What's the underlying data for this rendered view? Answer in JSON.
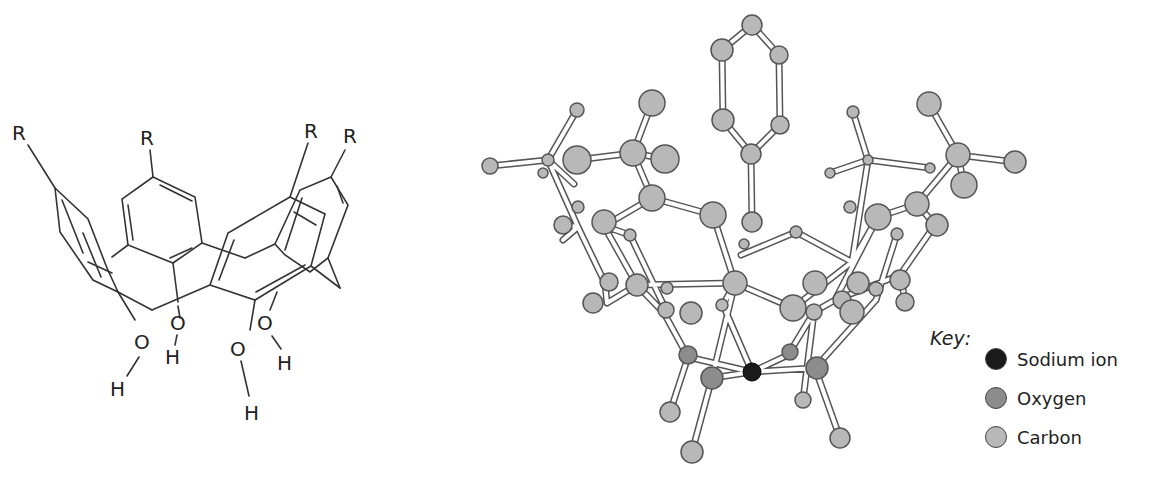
{
  "skeletal_formula": {
    "labels": {
      "r1": "R",
      "r2": "R",
      "r3": "R",
      "r4": "R",
      "o1": "O",
      "o2": "O",
      "o3": "O",
      "o4": "O",
      "h1": "H",
      "h2": "H",
      "h3": "H",
      "h4": "H"
    }
  },
  "ball_and_stick": {
    "colors": {
      "sodium": "#1a1a1a",
      "oxygen": "#8c8c8c",
      "carbon": "#b8b8b8",
      "outline": "#555555",
      "bond": "#ffffff"
    }
  },
  "key": {
    "title": "Key:",
    "items": [
      {
        "label": "Sodium ion",
        "color": "#1a1a1a"
      },
      {
        "label": "Oxygen",
        "color": "#8c8c8c"
      },
      {
        "label": "Carbon",
        "color": "#b8b8b8"
      }
    ]
  }
}
